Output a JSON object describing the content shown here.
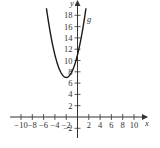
{
  "chart_data": {
    "type": "line",
    "title": "",
    "xlabel": "x",
    "ylabel": "y",
    "xlim": [
      -11,
      12
    ],
    "ylim": [
      -3,
      20.5
    ],
    "grid": false,
    "x_ticks": [
      -10,
      -8,
      -6,
      -4,
      -2,
      2,
      4,
      6,
      8,
      10
    ],
    "x_tick_labels": [
      "−10",
      "−8",
      "−6",
      "−4",
      "−2",
      "2",
      "4",
      "6",
      "8",
      "10"
    ],
    "y_ticks": [
      -2,
      2,
      4,
      6,
      8,
      10,
      12,
      14,
      16,
      18
    ],
    "y_tick_labels": [
      "−2",
      "2",
      "4",
      "6",
      "8",
      "10",
      "12",
      "14",
      "16",
      "18"
    ],
    "series": [
      {
        "name": "g",
        "formula": "g(x) = (x + 2)^2 + 7",
        "vertex": [
          -2,
          7
        ],
        "x": [
          -5.5,
          -5,
          -4.5,
          -4,
          -3.5,
          -3,
          -2.5,
          -2,
          -1.5,
          -1,
          -0.5,
          0,
          0.5,
          1,
          1.5
        ],
        "values": [
          19.25,
          16,
          13.25,
          11,
          9.25,
          8,
          7.25,
          7,
          7.25,
          8,
          9.25,
          11,
          13.25,
          16,
          19.25
        ],
        "color": "#1a1a1a"
      }
    ],
    "annotations": [
      {
        "text": "g",
        "x": 2,
        "y": 17,
        "italic": true
      }
    ],
    "legend": "none"
  },
  "labels": {
    "x_axis": "x",
    "y_axis": "y",
    "curve": "g"
  },
  "colors": {
    "axis": "#333333",
    "curve": "#1a1a1a",
    "background": "#ffffff"
  }
}
